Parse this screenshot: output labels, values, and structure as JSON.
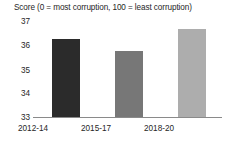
{
  "chart_data": {
    "type": "bar",
    "title": "Score (0 = most corruption, 100 = least corruption)",
    "xlabel": "",
    "ylabel": "",
    "categories": [
      "2012-14",
      "2015-17",
      "2018-20"
    ],
    "values": [
      36.1,
      35.6,
      36.5
    ],
    "series": [
      {
        "name": "Score",
        "values": [
          36.1,
          35.6,
          36.5
        ]
      }
    ],
    "ylim": [
      33,
      37
    ],
    "yticks": [
      33,
      34,
      35,
      36,
      37
    ],
    "ytick_labels": [
      "33",
      "34",
      "35",
      "36",
      "37"
    ],
    "grid": false,
    "legend": false,
    "bar_colors": [
      "#2b2b2b",
      "#777777",
      "#adadad"
    ],
    "axis_color": "#8a8a8a",
    "text_color": "#262626",
    "background": "#ffffff"
  }
}
